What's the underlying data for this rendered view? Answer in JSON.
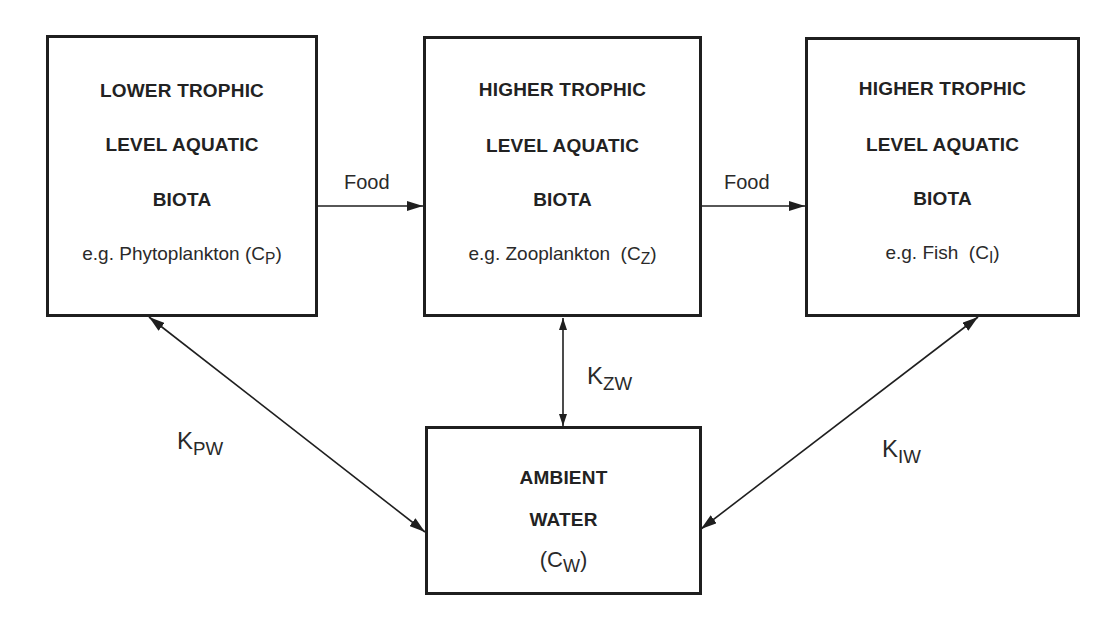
{
  "diagram": {
    "type": "flow/bioaccumulation compartment diagram",
    "colors": {
      "stroke": "#1f1f1f",
      "text": "#222222",
      "background": "#ffffff"
    },
    "nodes": {
      "lower": {
        "line1": "LOWER TROPHIC",
        "line2": "LEVEL AQUATIC",
        "line3": "BIOTA",
        "example_prefix": "e.g. Phytoplankton (",
        "symbol_main": "C",
        "symbol_sub": "P",
        "example_suffix": ")"
      },
      "zoo": {
        "line1": "HIGHER  TROPHIC",
        "line2": "LEVEL AQUATIC",
        "line3": "BIOTA",
        "example_prefix": "e.g. Zooplankton  (",
        "symbol_main": "C",
        "symbol_sub": "Z",
        "example_suffix": ")"
      },
      "fish": {
        "line1": "HIGHER TROPHIC",
        "line2": "LEVEL  AQUATIC",
        "line3": "BIOTA",
        "example_prefix": "e.g. Fish  (",
        "symbol_main": "C",
        "symbol_sub": "I",
        "example_suffix": ")"
      },
      "water": {
        "line1": "AMBIENT",
        "line2": "WATER",
        "line3_prefix": "(",
        "symbol_main": "C",
        "symbol_sub": "W",
        "line3_suffix": ")"
      }
    },
    "edges": {
      "food1": {
        "label": "Food",
        "from": "lower",
        "to": "zoo",
        "direction": "one-way"
      },
      "food2": {
        "label": "Food",
        "from": "zoo",
        "to": "fish",
        "direction": "one-way"
      },
      "kpw": {
        "main": "K",
        "sub": "PW",
        "from": "lower",
        "to": "water",
        "direction": "two-way"
      },
      "kzw": {
        "main": "K",
        "sub": "ZW",
        "from": "zoo",
        "to": "water",
        "direction": "two-way"
      },
      "kiw": {
        "main": "K",
        "sub": "IW",
        "from": "fish",
        "to": "water",
        "direction": "two-way"
      }
    }
  }
}
